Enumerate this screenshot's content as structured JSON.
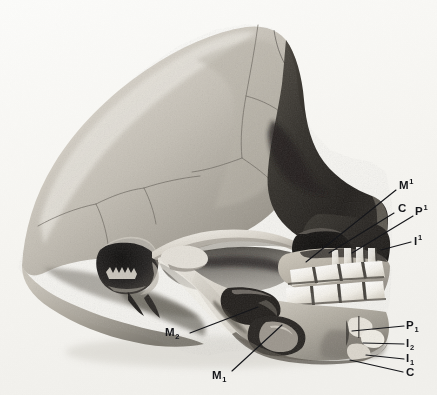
{
  "figure": {
    "medium": "halftone-photograph",
    "background_color": "#f7f6f3",
    "ink_color": "#15161a"
  },
  "labels": [
    {
      "id": "upper-first-molar",
      "name": "M",
      "position": "super",
      "index": "1",
      "x": 399,
      "y": 180,
      "leader": {
        "x1": 396,
        "y1": 190,
        "x2": 306,
        "y2": 262
      }
    },
    {
      "id": "upper-canine",
      "name": "C",
      "position": "none",
      "index": "",
      "x": 398,
      "y": 203,
      "leader": {
        "x1": 394,
        "y1": 213,
        "x2": 329,
        "y2": 253
      }
    },
    {
      "id": "upper-first-premolar",
      "name": "P",
      "position": "super",
      "index": "1",
      "x": 415,
      "y": 206,
      "leader": {
        "x1": 413,
        "y1": 216,
        "x2": 352,
        "y2": 253
      }
    },
    {
      "id": "upper-first-incisor",
      "name": "I",
      "position": "super",
      "index": "1",
      "x": 414,
      "y": 236,
      "leader": {
        "x1": 411,
        "y1": 242,
        "x2": 381,
        "y2": 250
      }
    },
    {
      "id": "lower-first-premolar",
      "name": "P",
      "position": "sub",
      "index": "1",
      "x": 406,
      "y": 320,
      "leader": {
        "x1": 404,
        "y1": 326,
        "x2": 352,
        "y2": 331
      }
    },
    {
      "id": "lower-second-incisor",
      "name": "I",
      "position": "sub",
      "index": "2",
      "x": 406,
      "y": 338,
      "leader": {
        "x1": 404,
        "y1": 344,
        "x2": 363,
        "y2": 343
      }
    },
    {
      "id": "lower-first-incisor",
      "name": "I",
      "position": "sub",
      "index": "1",
      "x": 406,
      "y": 353,
      "leader": {
        "x1": 404,
        "y1": 359,
        "x2": 366,
        "y2": 355
      }
    },
    {
      "id": "lower-canine",
      "name": "C",
      "position": "none",
      "index": "",
      "x": 406,
      "y": 367,
      "leader": {
        "x1": 403,
        "y1": 372,
        "x2": 350,
        "y2": 360
      }
    },
    {
      "id": "lower-second-molar",
      "name": "M",
      "position": "sub",
      "index": "2",
      "x": 165,
      "y": 327,
      "leader": {
        "x1": 190,
        "y1": 333,
        "x2": 258,
        "y2": 307
      }
    },
    {
      "id": "lower-first-molar",
      "name": "M",
      "position": "sub",
      "index": "1",
      "x": 212,
      "y": 370,
      "leader": {
        "x1": 232,
        "y1": 371,
        "x2": 282,
        "y2": 325
      }
    }
  ]
}
